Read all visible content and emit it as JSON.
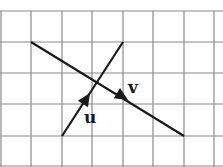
{
  "diagram": {
    "type": "vector-grid",
    "grid": {
      "x_lines": [
        1,
        31,
        62,
        92,
        123,
        153,
        184,
        214
      ],
      "y_lines": [
        11,
        42,
        73,
        104,
        136,
        166
      ],
      "color": "#8a8a8a"
    },
    "vectors": [
      {
        "label": "u",
        "from": [
          62,
          136
        ],
        "to": [
          123,
          42
        ],
        "arrow_at": [
          90,
          93
        ],
        "label_pos": [
          84,
          123
        ]
      },
      {
        "label": "v",
        "from": [
          31,
          42
        ],
        "to": [
          184,
          136
        ],
        "arrow_at": [
          128,
          100
        ],
        "label_pos": [
          128,
          93
        ]
      }
    ],
    "line_color": "#1a1a1a"
  }
}
